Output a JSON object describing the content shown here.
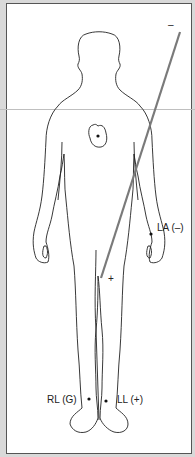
{
  "figure": {
    "labels": {
      "negative_top": "–",
      "left_arm": "LA (–)",
      "plus_sign": "+",
      "right_leg": "RL (G)",
      "left_leg": "LL (+)"
    },
    "lead_line_color": "#7a7a7a",
    "outline_color": "#222222"
  }
}
